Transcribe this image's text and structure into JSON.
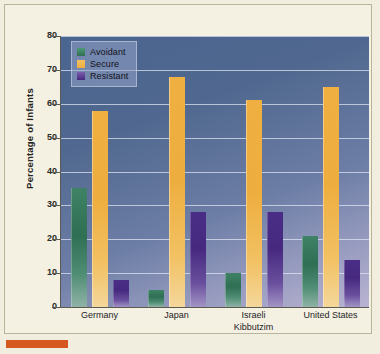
{
  "chart_data": {
    "type": "bar",
    "title": "",
    "xlabel": "",
    "ylabel": "Percentage of Infants",
    "ylim": [
      0,
      80
    ],
    "ytick_labels": [
      "80",
      "70",
      "60",
      "50",
      "40",
      "30",
      "20",
      "10",
      "0"
    ],
    "ytick_values": [
      80,
      70,
      60,
      50,
      40,
      30,
      20,
      10,
      0
    ],
    "grid": true,
    "legend_position": "top-left",
    "categories": [
      "Germany",
      "Japan",
      "Israeli\nKibbutzim",
      "United States"
    ],
    "category_lines": [
      [
        "Germany"
      ],
      [
        "Japan"
      ],
      [
        "Israeli",
        "Kibbutzim"
      ],
      [
        "United States"
      ]
    ],
    "series": [
      {
        "name": "Avoidant",
        "color": "#2f6f54",
        "values": [
          35,
          5,
          10,
          21
        ]
      },
      {
        "name": "Secure",
        "color": "#eeae3f",
        "values": [
          58,
          68,
          61,
          65
        ]
      },
      {
        "name": "Resistant",
        "color": "#46297f",
        "values": [
          8,
          28,
          28,
          14
        ]
      }
    ]
  },
  "legend": {
    "items": [
      {
        "label": "Avoidant"
      },
      {
        "label": "Secure"
      },
      {
        "label": "Resistant"
      }
    ]
  },
  "colors": {
    "page_background": "#f2eedf",
    "plot_background_top": "#4a6590",
    "plot_background_bottom": "#b9b3d2",
    "gridline": "#e2e8f5",
    "axis": "#5a5a4e",
    "avoidant": "#2f6f54",
    "secure": "#eeae3f",
    "resistant": "#46297f",
    "corner_mark": "#d4581f"
  }
}
